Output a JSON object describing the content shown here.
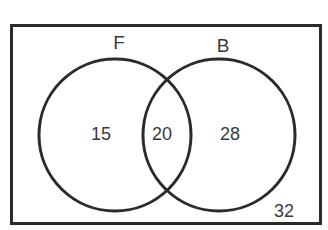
{
  "diagram": {
    "type": "venn",
    "sets": [
      {
        "id": "F",
        "label": "F"
      },
      {
        "id": "B",
        "label": "B"
      }
    ],
    "regions": {
      "only_F": {
        "label": "15",
        "value": 15
      },
      "F_and_B": {
        "label": "20",
        "value": 20
      },
      "only_B": {
        "label": "28",
        "value": 28
      },
      "neither": {
        "label": "32",
        "value": 32
      }
    },
    "colors": {
      "stroke": "#2b2b2b",
      "text": "#3a3a3a",
      "background": "#ffffff"
    }
  }
}
